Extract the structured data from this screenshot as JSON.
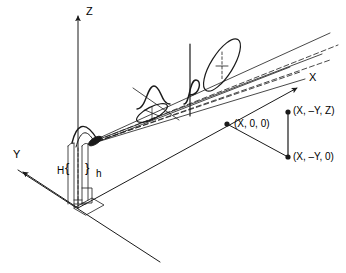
{
  "diagram": {
    "background_color": "#ffffff",
    "stroke_color": "#1a1a1a",
    "axes": {
      "z": {
        "label": "Z",
        "label_x": 86,
        "label_y": 6,
        "arrow_tip_x": 78,
        "arrow_tip_y": 10,
        "origin_x": 78,
        "origin_y": 208
      },
      "x": {
        "label": "X",
        "label_x": 309,
        "label_y": 72,
        "arrow_tip_x": 302,
        "arrow_tip_y": 84,
        "origin_x": 78,
        "origin_y": 208
      },
      "y": {
        "label": "Y",
        "label_x": 13,
        "label_y": 149,
        "arrow_tip_x": 14,
        "arrow_tip_y": 172,
        "origin_x": 78,
        "origin_y": 208
      }
    },
    "mast": {
      "height_label_outer": "H",
      "height_label_inner": "h",
      "brace_open": "{",
      "brace_close": "}",
      "H_label_x": 57,
      "H_label_y": 166,
      "h_label_x": 96,
      "h_label_y": 169,
      "brace_open_x": 66,
      "brace_open_y": 163,
      "brace_close_x": 86,
      "brace_close_y": 163
    },
    "points": [
      {
        "name": "point-x-0-0",
        "label": "(X, 0, 0)",
        "dot_x": 227,
        "dot_y": 124,
        "label_x": 234,
        "label_y": 119
      },
      {
        "name": "point-x-my-z",
        "label": "(X, –Y, Z)",
        "dot_x": 288,
        "dot_y": 112,
        "label_x": 293,
        "label_y": 106
      },
      {
        "name": "point-x-my-0",
        "label": "(X, –Y, 0)",
        "dot_x": 288,
        "dot_y": 157,
        "label_x": 293,
        "label_y": 152
      }
    ],
    "beam": {
      "source_x": 95,
      "source_y": 142,
      "near_lobe": {
        "cx": 152,
        "cy": 112,
        "rx": 17,
        "ry": 6.5,
        "rotation": -28
      },
      "far_lobe": {
        "cx": 222,
        "cy": 65,
        "rx": 30,
        "ry": 11,
        "rotation": -30
      },
      "cross_section_plane_x": 190,
      "cross_section_plane_top": 44,
      "cross_section_plane_bottom": 116
    }
  }
}
